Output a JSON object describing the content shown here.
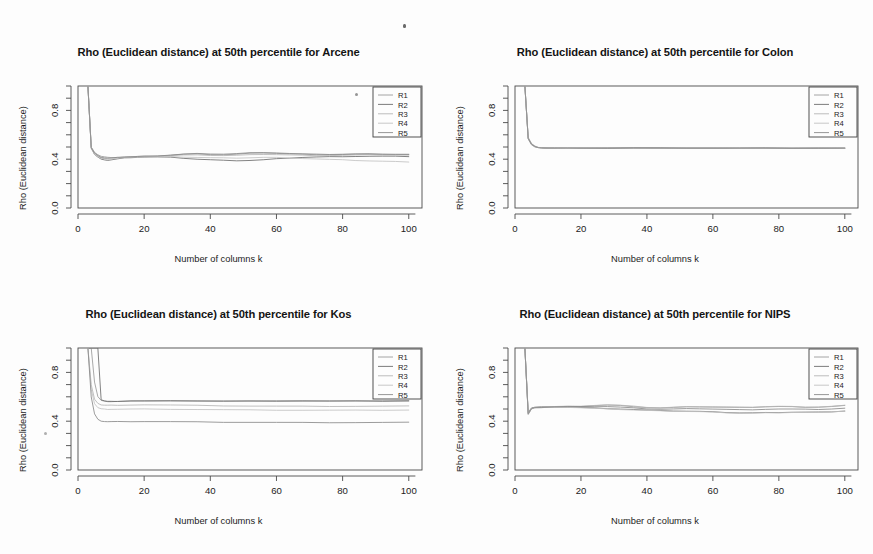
{
  "figure": {
    "background_color": "#fdfdfd",
    "line_colors": [
      "#9a9a9a",
      "#6d6d6d",
      "#b5b5b5",
      "#c2c2c2",
      "#8a8a8a"
    ],
    "axis_color": "#4a4a4a",
    "panel_layout": "2x2"
  },
  "panels": [
    {
      "id": "arcene",
      "title": "Rho (Euclidean distance) at 50th percentile for Arcene",
      "xlabel": "Number of columns k",
      "ylabel": "Rho (Euclidean distance)",
      "xticks": [
        "0",
        "20",
        "40",
        "60",
        "80",
        "100"
      ],
      "yticks": [
        "0.0",
        "0.4",
        "0.8"
      ],
      "legend": [
        "R1",
        "R2",
        "R3",
        "R4",
        "R5"
      ]
    },
    {
      "id": "colon",
      "title": "Rho (Euclidean distance) at 50th percentile for Colon",
      "xlabel": "Number of columns k",
      "ylabel": "Rho (Euclidean distance)",
      "xticks": [
        "0",
        "20",
        "40",
        "60",
        "80",
        "100"
      ],
      "yticks": [
        "0.0",
        "0.4",
        "0.8"
      ],
      "legend": [
        "R1",
        "R2",
        "R3",
        "R4",
        "R5"
      ]
    },
    {
      "id": "kos",
      "title": "Rho (Euclidean distance) at 50th percentile for Kos",
      "xlabel": "Number of columns k",
      "ylabel": "Rho (Euclidean distance)",
      "xticks": [
        "0",
        "20",
        "40",
        "60",
        "80",
        "100"
      ],
      "yticks": [
        "0.0",
        "0.4",
        "0.8"
      ],
      "legend": [
        "R1",
        "R2",
        "R3",
        "R4",
        "R5"
      ]
    },
    {
      "id": "nips",
      "title": "Rho (Euclidean distance) at 50th percentile for NIPS",
      "xlabel": "Number of columns k",
      "ylabel": "Rho (Euclidean distance)",
      "xticks": [
        "0",
        "20",
        "40",
        "60",
        "80",
        "100"
      ],
      "yticks": [
        "0.0",
        "0.4",
        "0.8"
      ],
      "legend": [
        "R1",
        "R2",
        "R3",
        "R4",
        "R5"
      ]
    }
  ],
  "chart_data": [
    {
      "type": "line",
      "panel": "arcene",
      "title": "Rho (Euclidean distance) at 50th percentile for Arcene",
      "xlabel": "Number of columns k",
      "ylabel": "Rho (Euclidean distance)",
      "xlim": [
        0,
        104
      ],
      "ylim": [
        0.0,
        1.0
      ],
      "xticks": [
        0,
        20,
        40,
        60,
        80,
        100
      ],
      "yticks": [
        0.0,
        0.4,
        0.8
      ],
      "grid": false,
      "legend_position": "top-right",
      "legend": [
        "R1",
        "R2",
        "R3",
        "R4",
        "R5"
      ],
      "x": [
        3,
        4,
        5,
        6,
        7,
        8,
        9,
        10,
        12,
        14,
        16,
        18,
        20,
        24,
        28,
        32,
        36,
        40,
        44,
        48,
        52,
        56,
        60,
        64,
        68,
        72,
        76,
        80,
        84,
        88,
        92,
        96,
        100
      ],
      "series": [
        {
          "name": "R1",
          "values": [
            1.0,
            0.5,
            0.455,
            0.435,
            0.425,
            0.42,
            0.415,
            0.412,
            0.415,
            0.418,
            0.42,
            0.421,
            0.422,
            0.425,
            0.432,
            0.44,
            0.442,
            0.438,
            0.436,
            0.44,
            0.448,
            0.452,
            0.448,
            0.443,
            0.44,
            0.438,
            0.437,
            0.438,
            0.44,
            0.441,
            0.44,
            0.438,
            0.437
          ]
        },
        {
          "name": "R2",
          "values": [
            1.0,
            0.49,
            0.44,
            0.418,
            0.4,
            0.393,
            0.392,
            0.395,
            0.403,
            0.41,
            0.414,
            0.416,
            0.418,
            0.418,
            0.415,
            0.408,
            0.4,
            0.395,
            0.39,
            0.388,
            0.39,
            0.395,
            0.403,
            0.41,
            0.415,
            0.418,
            0.42,
            0.422,
            0.423,
            0.424,
            0.424,
            0.423,
            0.422
          ]
        },
        {
          "name": "R3",
          "values": [
            1.0,
            0.5,
            0.452,
            0.43,
            0.418,
            0.412,
            0.41,
            0.41,
            0.414,
            0.418,
            0.42,
            0.422,
            0.423,
            0.426,
            0.43,
            0.434,
            0.434,
            0.432,
            0.43,
            0.432,
            0.436,
            0.44,
            0.438,
            0.435,
            0.432,
            0.43,
            0.43,
            0.432,
            0.434,
            0.436,
            0.436,
            0.435,
            0.433
          ]
        },
        {
          "name": "R4",
          "values": [
            1.0,
            0.485,
            0.44,
            0.42,
            0.408,
            0.402,
            0.4,
            0.402,
            0.408,
            0.413,
            0.416,
            0.418,
            0.419,
            0.42,
            0.42,
            0.418,
            0.415,
            0.412,
            0.41,
            0.41,
            0.412,
            0.415,
            0.414,
            0.41,
            0.406,
            0.402,
            0.398,
            0.394,
            0.39,
            0.386,
            0.383,
            0.38,
            0.378
          ]
        },
        {
          "name": "R5",
          "values": [
            1.0,
            0.495,
            0.45,
            0.428,
            0.415,
            0.41,
            0.408,
            0.409,
            0.414,
            0.418,
            0.42,
            0.422,
            0.424,
            0.428,
            0.434,
            0.442,
            0.446,
            0.444,
            0.442,
            0.446,
            0.452,
            0.456,
            0.452,
            0.447,
            0.443,
            0.44,
            0.44,
            0.441,
            0.443,
            0.444,
            0.443,
            0.441,
            0.44
          ]
        }
      ]
    },
    {
      "type": "line",
      "panel": "colon",
      "title": "Rho (Euclidean distance) at 50th percentile for Colon",
      "xlabel": "Number of columns k",
      "ylabel": "Rho (Euclidean distance)",
      "xlim": [
        0,
        104
      ],
      "ylim": [
        0.0,
        1.0
      ],
      "xticks": [
        0,
        20,
        40,
        60,
        80,
        100
      ],
      "yticks": [
        0.0,
        0.4,
        0.8
      ],
      "grid": false,
      "legend_position": "top-right",
      "legend": [
        "R1",
        "R2",
        "R3",
        "R4",
        "R5"
      ],
      "x": [
        3,
        4,
        5,
        6,
        7,
        8,
        10,
        12,
        16,
        20,
        28,
        36,
        44,
        52,
        60,
        68,
        76,
        84,
        92,
        100
      ],
      "series": [
        {
          "name": "R1",
          "values": [
            1.0,
            0.575,
            0.525,
            0.505,
            0.497,
            0.494,
            0.492,
            0.491,
            0.491,
            0.492,
            0.492,
            0.493,
            0.492,
            0.492,
            0.491,
            0.491,
            0.491,
            0.491,
            0.491,
            0.491
          ]
        },
        {
          "name": "R2",
          "values": [
            1.0,
            0.565,
            0.52,
            0.502,
            0.495,
            0.492,
            0.49,
            0.489,
            0.489,
            0.49,
            0.49,
            0.491,
            0.49,
            0.49,
            0.489,
            0.489,
            0.489,
            0.489,
            0.489,
            0.489
          ]
        },
        {
          "name": "R3",
          "values": [
            1.0,
            0.58,
            0.528,
            0.507,
            0.499,
            0.495,
            0.493,
            0.492,
            0.492,
            0.493,
            0.493,
            0.494,
            0.493,
            0.493,
            0.492,
            0.492,
            0.492,
            0.492,
            0.492,
            0.492
          ]
        },
        {
          "name": "R4",
          "values": [
            1.0,
            0.57,
            0.522,
            0.503,
            0.496,
            0.493,
            0.491,
            0.49,
            0.49,
            0.491,
            0.491,
            0.492,
            0.491,
            0.491,
            0.49,
            0.49,
            0.49,
            0.49,
            0.49,
            0.49
          ]
        },
        {
          "name": "R5",
          "values": [
            1.0,
            0.572,
            0.524,
            0.504,
            0.497,
            0.494,
            0.492,
            0.491,
            0.491,
            0.492,
            0.492,
            0.493,
            0.492,
            0.492,
            0.491,
            0.491,
            0.491,
            0.491,
            0.491,
            0.491
          ]
        }
      ]
    },
    {
      "type": "line",
      "panel": "kos",
      "title": "Rho (Euclidean distance) at 50th percentile for Kos",
      "xlabel": "Number of columns k",
      "ylabel": "Rho (Euclidean distance)",
      "xlim": [
        0,
        104
      ],
      "ylim": [
        0.0,
        1.0
      ],
      "xticks": [
        0,
        20,
        40,
        60,
        80,
        100
      ],
      "yticks": [
        0.0,
        0.4,
        0.8
      ],
      "grid": false,
      "legend_position": "top-right",
      "legend": [
        "R1",
        "R2",
        "R3",
        "R4",
        "R5"
      ],
      "x": [
        3,
        4,
        5,
        6,
        7,
        8,
        9,
        10,
        12,
        16,
        20,
        28,
        36,
        44,
        52,
        60,
        68,
        76,
        84,
        92,
        100
      ],
      "series": [
        {
          "name": "R1",
          "values": [
            1.0,
            1.0,
            0.72,
            0.6,
            0.572,
            0.565,
            0.563,
            0.562,
            0.563,
            0.566,
            0.568,
            0.568,
            0.567,
            0.565,
            0.565,
            0.566,
            0.566,
            0.566,
            0.566,
            0.566,
            0.567
          ]
        },
        {
          "name": "R2",
          "values": [
            1.0,
            1.0,
            1.0,
            1.0,
            0.575,
            0.565,
            0.562,
            0.561,
            0.562,
            0.565,
            0.567,
            0.567,
            0.566,
            0.564,
            0.564,
            0.565,
            0.565,
            0.565,
            0.565,
            0.565,
            0.566
          ]
        },
        {
          "name": "R3",
          "values": [
            1.0,
            0.7,
            0.58,
            0.545,
            0.535,
            0.532,
            0.531,
            0.531,
            0.532,
            0.533,
            0.534,
            0.532,
            0.529,
            0.526,
            0.524,
            0.523,
            0.522,
            0.522,
            0.522,
            0.523,
            0.524
          ]
        },
        {
          "name": "R4",
          "values": [
            1.0,
            0.66,
            0.545,
            0.512,
            0.502,
            0.499,
            0.498,
            0.498,
            0.498,
            0.499,
            0.499,
            0.498,
            0.496,
            0.494,
            0.492,
            0.491,
            0.49,
            0.49,
            0.49,
            0.491,
            0.492
          ]
        },
        {
          "name": "R5",
          "values": [
            1.0,
            0.6,
            0.46,
            0.415,
            0.402,
            0.398,
            0.396,
            0.396,
            0.396,
            0.397,
            0.397,
            0.396,
            0.394,
            0.392,
            0.391,
            0.39,
            0.389,
            0.389,
            0.389,
            0.39,
            0.391
          ]
        }
      ]
    },
    {
      "type": "line",
      "panel": "nips",
      "title": "Rho (Euclidean distance) at 50th percentile for NIPS",
      "xlabel": "Number of columns k",
      "ylabel": "Rho (Euclidean distance)",
      "xlim": [
        0,
        104
      ],
      "ylim": [
        0.0,
        1.0
      ],
      "xticks": [
        0,
        20,
        40,
        60,
        80,
        100
      ],
      "yticks": [
        0.0,
        0.4,
        0.8
      ],
      "grid": false,
      "legend_position": "top-right",
      "legend": [
        "R1",
        "R2",
        "R3",
        "R4",
        "R5"
      ],
      "x": [
        3,
        4,
        5,
        6,
        8,
        10,
        12,
        16,
        20,
        24,
        28,
        32,
        36,
        40,
        44,
        48,
        52,
        56,
        60,
        64,
        68,
        72,
        76,
        80,
        84,
        88,
        92,
        96,
        100
      ],
      "series": [
        {
          "name": "R1",
          "values": [
            1.0,
            0.455,
            0.5,
            0.508,
            0.512,
            0.515,
            0.518,
            0.52,
            0.522,
            0.528,
            0.532,
            0.528,
            0.52,
            0.512,
            0.508,
            0.512,
            0.516,
            0.518,
            0.516,
            0.514,
            0.512,
            0.514,
            0.518,
            0.52,
            0.518,
            0.515,
            0.515,
            0.52,
            0.528
          ]
        },
        {
          "name": "R2",
          "values": [
            1.0,
            0.47,
            0.51,
            0.515,
            0.518,
            0.518,
            0.518,
            0.516,
            0.512,
            0.508,
            0.504,
            0.5,
            0.496,
            0.49,
            0.486,
            0.484,
            0.482,
            0.48,
            0.476,
            0.472,
            0.468,
            0.468,
            0.47,
            0.472,
            0.474,
            0.474,
            0.474,
            0.478,
            0.484
          ]
        },
        {
          "name": "R3",
          "values": [
            1.0,
            0.46,
            0.502,
            0.51,
            0.514,
            0.517,
            0.52,
            0.522,
            0.524,
            0.53,
            0.534,
            0.53,
            0.522,
            0.514,
            0.51,
            0.514,
            0.518,
            0.52,
            0.518,
            0.516,
            0.514,
            0.516,
            0.52,
            0.522,
            0.52,
            0.517,
            0.517,
            0.522,
            0.53
          ]
        },
        {
          "name": "R4",
          "values": [
            1.0,
            0.465,
            0.505,
            0.512,
            0.515,
            0.516,
            0.516,
            0.514,
            0.51,
            0.505,
            0.5,
            0.496,
            0.492,
            0.488,
            0.484,
            0.482,
            0.48,
            0.478,
            0.474,
            0.47,
            0.466,
            0.466,
            0.468,
            0.47,
            0.472,
            0.472,
            0.472,
            0.476,
            0.482
          ]
        },
        {
          "name": "R5",
          "values": [
            1.0,
            0.462,
            0.503,
            0.511,
            0.514,
            0.516,
            0.518,
            0.519,
            0.519,
            0.52,
            0.52,
            0.515,
            0.508,
            0.502,
            0.498,
            0.5,
            0.502,
            0.503,
            0.5,
            0.497,
            0.494,
            0.495,
            0.498,
            0.5,
            0.499,
            0.497,
            0.497,
            0.5,
            0.506
          ]
        }
      ]
    }
  ]
}
